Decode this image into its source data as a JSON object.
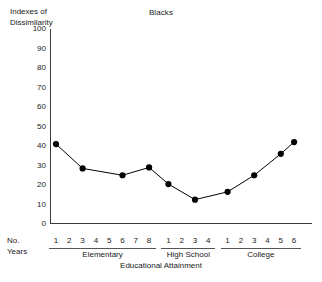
{
  "chart_data": {
    "type": "line",
    "title": "Blacks",
    "xlabel": "Educational Attainment",
    "ylabel": "Indexes of Dissimilarity",
    "ylim": [
      0,
      100
    ],
    "ytick_labels": [
      "100",
      "90",
      "80",
      "70",
      "60",
      "50",
      "40",
      "30",
      "20",
      "10",
      "0"
    ],
    "ytick_values": [
      100,
      90,
      80,
      70,
      60,
      50,
      40,
      30,
      20,
      10,
      0
    ],
    "grid": false,
    "legend": "none",
    "corner_label": "No. Years",
    "corner_label_lines": [
      "No.",
      "Years"
    ],
    "groups": [
      {
        "name": "Elementary",
        "ticks": [
          "1",
          "2",
          "3",
          "4",
          "5",
          "6",
          "7",
          "8"
        ]
      },
      {
        "name": "High School",
        "ticks": [
          "1",
          "2",
          "3",
          "4"
        ]
      },
      {
        "name": "College",
        "ticks": [
          "1",
          "2",
          "3",
          "4",
          "5",
          "6"
        ]
      }
    ],
    "series": [
      {
        "name": "Blacks",
        "marker": "filled-circle",
        "color": "#000000",
        "points": [
          {
            "group": "Elementary",
            "year": "1",
            "slot": 0,
            "value": 41
          },
          {
            "group": "Elementary",
            "year": "3",
            "slot": 2,
            "value": 28.5
          },
          {
            "group": "Elementary",
            "year": "6",
            "slot": 5,
            "value": 25
          },
          {
            "group": "Elementary",
            "year": "8",
            "slot": 7,
            "value": 29
          },
          {
            "group": "High School",
            "year": "1",
            "slot": 8,
            "value": 20.5
          },
          {
            "group": "High School",
            "year": "3",
            "slot": 10,
            "value": 12.5
          },
          {
            "group": "College",
            "year": "1",
            "slot": 12,
            "value": 16.5
          },
          {
            "group": "College",
            "year": "3",
            "slot": 14,
            "value": 25
          },
          {
            "group": "College",
            "year": "5",
            "slot": 16,
            "value": 36
          },
          {
            "group": "College",
            "year": "6",
            "slot": 17,
            "value": 42
          }
        ]
      }
    ],
    "colors": {
      "background": "#ffffff",
      "axis": "#3a3a3a",
      "line": "#111111",
      "marker": "#000000",
      "text": "#1a1a1a",
      "rule": "#555555"
    }
  }
}
